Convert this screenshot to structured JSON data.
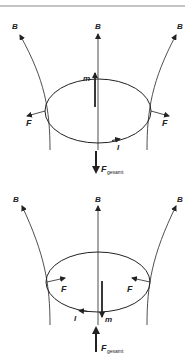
{
  "diagram": {
    "top_rule": true,
    "panels": [
      {
        "id": "top",
        "labels": {
          "b_left": "B",
          "b_center": "B",
          "b_right": "B",
          "moment": "m",
          "force_left": "F",
          "force_right": "F",
          "current": "I",
          "total_force": "F",
          "total_force_sub": "gesamt"
        },
        "moment_direction": "up",
        "force_direction": "outward-down",
        "total_force_direction": "down"
      },
      {
        "id": "bottom",
        "labels": {
          "b_left": "B",
          "b_center": "B",
          "b_right": "B",
          "moment": "m",
          "force_left": "F",
          "force_right": "F",
          "current": "I",
          "total_force": "F",
          "total_force_sub": "gesamt"
        },
        "moment_direction": "down",
        "force_direction": "inward-up",
        "total_force_direction": "up"
      }
    ],
    "colors": {
      "line": "#222222",
      "background": "#ffffff"
    }
  }
}
